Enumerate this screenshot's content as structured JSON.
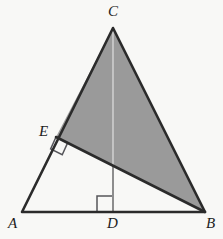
{
  "figure": {
    "type": "geometry-diagram",
    "canvas": {
      "width": 223,
      "height": 239
    },
    "colors": {
      "background": "#f8f8f6",
      "stroke": "#2b2b2b",
      "thin_stroke": "#6e6e6e",
      "shaded_fill": "#9a9a9a",
      "label": "#1d1d1d",
      "right_angle_stroke": "#55555a",
      "altitude_line": "#cfcfcf"
    },
    "points": [
      {
        "name": "A",
        "label": "A",
        "x": 22,
        "y": 212,
        "label_x": 8,
        "label_y": 216
      },
      {
        "name": "B",
        "label": "B",
        "x": 205,
        "y": 212,
        "label_x": 206,
        "label_y": 216
      },
      {
        "name": "C",
        "label": "C",
        "x": 113,
        "y": 28,
        "label_x": 108,
        "label_y": 4
      },
      {
        "name": "D",
        "label": "D",
        "x": 113,
        "y": 212,
        "label_x": 107,
        "label_y": 216
      },
      {
        "name": "E",
        "label": "E",
        "x": 56,
        "y": 137,
        "label_x": 39,
        "label_y": 124
      }
    ],
    "segments": [
      {
        "name": "side-AB",
        "from": "A",
        "to": "B",
        "style": "thick"
      },
      {
        "name": "side-AC",
        "from": "A",
        "to": "C",
        "style": "thick"
      },
      {
        "name": "side-CB",
        "from": "C",
        "to": "B",
        "style": "thick"
      },
      {
        "name": "segment-EB",
        "from": "E",
        "to": "B",
        "style": "thick"
      },
      {
        "name": "altitude-CD",
        "from": "C",
        "to": "D",
        "style": "thin"
      }
    ],
    "shaded_region": {
      "name": "triangle-ECB",
      "vertices": [
        "E",
        "C",
        "B"
      ],
      "fill": "#9a9a9a"
    },
    "right_angles": [
      {
        "name": "right-angle-at-D",
        "vertex": "D",
        "note": "CD perpendicular to AB"
      },
      {
        "name": "right-angle-at-E",
        "vertex": "E",
        "note": "EB perpendicular to AC"
      }
    ]
  }
}
